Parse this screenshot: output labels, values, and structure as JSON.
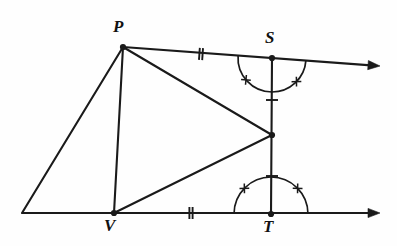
{
  "figure": {
    "background_color": "#fefefe",
    "stroke_color": "#1a1a1a",
    "points": [
      {
        "name": "P",
        "label": "P",
        "x": 123,
        "y": 47,
        "label_x": 113,
        "label_y": 18,
        "dot": true
      },
      {
        "name": "S",
        "label": "S",
        "x": 272,
        "y": 58,
        "label_x": 265,
        "label_y": 29,
        "dot": true
      },
      {
        "name": "T",
        "label": "T",
        "x": 271,
        "y": 214,
        "label_x": 263,
        "label_y": 218,
        "dot": true
      },
      {
        "name": "V",
        "label": "V",
        "x": 114,
        "y": 213,
        "label_x": 104,
        "label_y": 217,
        "dot": true
      },
      {
        "name": "M",
        "label": "",
        "x": 272,
        "y": 135,
        "label_x": 0,
        "label_y": 0,
        "dot": true
      },
      {
        "name": "L",
        "label": "",
        "x": 22,
        "y": 213,
        "label_x": 0,
        "label_y": 0,
        "dot": false
      }
    ],
    "segments": [
      {
        "name": "segment-L-P",
        "from": "L",
        "to": "P"
      },
      {
        "name": "segment-P-V",
        "from": "P",
        "to": "V"
      },
      {
        "name": "segment-P-M",
        "from": "P",
        "to": "M"
      },
      {
        "name": "segment-V-M",
        "from": "V",
        "to": "M"
      },
      {
        "name": "segment-S-T",
        "from": "S",
        "to": "T"
      }
    ],
    "rays": [
      {
        "name": "ray-P-through-S",
        "from_x": 123,
        "from_y": 47,
        "to_x": 380,
        "to_y": 66,
        "arrow": true
      },
      {
        "name": "ray-L-through-T",
        "from_x": 22,
        "from_y": 213,
        "to_x": 380,
        "to_y": 213,
        "arrow": true
      }
    ],
    "tick_marks": [
      {
        "name": "tick-PS-double",
        "on": "segment P-S",
        "x": 201,
        "y": 54,
        "angle": 4,
        "count": 2,
        "style": "bar"
      },
      {
        "name": "tick-VT-double",
        "on": "segment V-T",
        "x": 191,
        "y": 213,
        "angle": 0,
        "count": 2,
        "style": "bar"
      },
      {
        "name": "tick-SM-single",
        "on": "segment S-M",
        "x": 272,
        "y": 100,
        "angle": 90,
        "count": 1,
        "style": "bar"
      },
      {
        "name": "tick-MT-single",
        "on": "segment M-T",
        "x": 272,
        "y": 176,
        "angle": 90,
        "count": 1,
        "style": "bar"
      }
    ],
    "angle_arcs": [
      {
        "name": "arc-angle-PST-left",
        "cx": 272,
        "cy": 58,
        "radius": 34,
        "start_deg": 90,
        "end_deg": 184,
        "tick_deg": 140
      },
      {
        "name": "arc-angle-MST-right",
        "cx": 272,
        "cy": 58,
        "radius": 34,
        "start_deg": 4,
        "end_deg": 90,
        "tick_deg": 44
      },
      {
        "name": "arc-angle-VTS-left",
        "cx": 271,
        "cy": 214,
        "radius": 37,
        "start_deg": 180,
        "end_deg": 270,
        "tick_deg": 224
      },
      {
        "name": "arc-angle-STR-right",
        "cx": 271,
        "cy": 214,
        "radius": 37,
        "start_deg": 270,
        "end_deg": 360,
        "tick_deg": 316
      }
    ],
    "notation": {
      "equal_sides_double": "PS = VT",
      "equal_sides_single": "SM = MT",
      "equal_angles": "angles at S and T marked congruent"
    }
  }
}
